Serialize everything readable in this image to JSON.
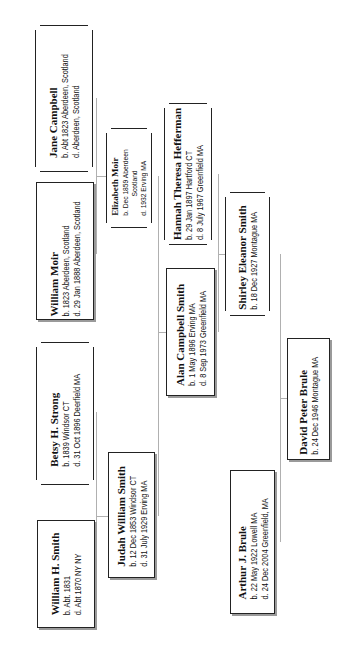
{
  "diagram": {
    "type": "family-tree",
    "orientation": "rotated-90-ccw",
    "people": {
      "jane_campbell": {
        "name": "Jane Campbell",
        "lines": [
          "b. Abt 1823 Aberdeen, Scotland",
          "d. Aberdeen,  Scotland"
        ]
      },
      "william_moir": {
        "name": "William Moir",
        "lines": [
          "b. 1823 Aberdeen, Scotland",
          "d. 29 Jan 1888  Aberdeen, Scotland"
        ]
      },
      "betsy_strong": {
        "name": "Betsy H. Strong",
        "lines": [
          "b. 1839 Windsor CT",
          "d. 31 Oct 1896 Deerfield MA"
        ]
      },
      "william_smith": {
        "name": "William H. Smith",
        "lines": [
          "b. Abt. 1831",
          "d. Abt 1870 NY NY"
        ]
      },
      "elizabeth_moir": {
        "name": "Elizabeth Moir",
        "lines": [
          "b. Dec 1859 Aberdeen",
          "Scotland",
          "d. 1932 Erving MA"
        ]
      },
      "judah_smith": {
        "name": "Judah William Smith",
        "lines": [
          "b. 12 Dec 1853 Windsor CT",
          "d. 31  July 1929 Erving MA"
        ]
      },
      "hannah_hefferman": {
        "name": "Hannah Theresa Hefferman",
        "lines": [
          "b. 29 Jan 1897 Hartford CT",
          "d. 8 July 1967 Greenfield MA"
        ]
      },
      "alan_smith": {
        "name": "Alan Campbell Smith",
        "lines": [
          "b. 1 May 1896 Erving MA",
          "d. 8 Sep 1973 Greenfield MA"
        ]
      },
      "shirley_smith": {
        "name": "Shirley Eleanor Smith",
        "lines": [
          "b. 18 Dec 1927 Montague MA"
        ]
      },
      "david_brule": {
        "name": "David Peter Brule",
        "lines": [
          "b. 24 Dec 1946 Montague MA"
        ]
      },
      "arthur_brule": {
        "name": "Arthur J. Brule",
        "lines": [
          "b. 22 May 1922 Lowell MA",
          "d. 24 Dec 2004 Greenfield, MA"
        ]
      }
    },
    "relationships": [
      {
        "parents": [
          "William Moir",
          "Jane Campbell"
        ],
        "child": "Elizabeth Moir"
      },
      {
        "parents": [
          "William H. Smith",
          "Betsy H. Strong"
        ],
        "child": "Judah William Smith"
      },
      {
        "parents": [
          "Judah William Smith",
          "Elizabeth Moir"
        ],
        "child": "Alan Campbell Smith"
      },
      {
        "parents": [
          "Alan Campbell Smith",
          "Hannah Theresa Hefferman"
        ],
        "child": "Shirley Eleanor Smith"
      },
      {
        "parents": [
          "Arthur J. Brule",
          "Shirley Eleanor Smith"
        ],
        "child": "David Peter Brule"
      }
    ]
  }
}
